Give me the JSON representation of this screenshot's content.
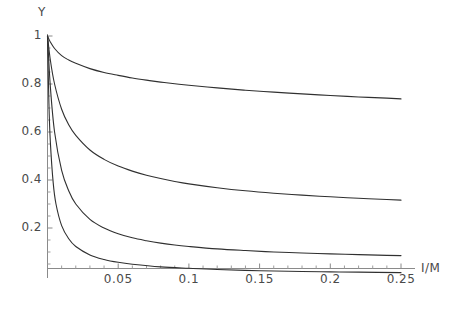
{
  "chart_data": {
    "type": "line",
    "title": "",
    "subtitle": "",
    "xlabel": "I/M",
    "ylabel": "Y",
    "xlim": [
      0,
      0.26
    ],
    "ylim": [
      0,
      1.05
    ],
    "grid": false,
    "legend": "none",
    "xticks": [
      0.05,
      0.1,
      0.15,
      0.2,
      0.25
    ],
    "xtick_labels": [
      "0.05",
      "0.1",
      "0.15",
      "0.2",
      "0.25"
    ],
    "yticks": [
      0.2,
      0.4,
      0.6,
      0.8,
      1
    ],
    "ytick_labels": [
      "0.2",
      "0.4",
      "0.6",
      "0.8",
      "1"
    ],
    "line_color": "#303030",
    "axis_color": "#808080",
    "series": [
      {
        "name": "curve-1",
        "asymptote": 0.72,
        "x": [
          0.0,
          0.002,
          0.005,
          0.01,
          0.015,
          0.02,
          0.03,
          0.04,
          0.05,
          0.06,
          0.07,
          0.08,
          0.09,
          0.1,
          0.12,
          0.14,
          0.16,
          0.18,
          0.2,
          0.22,
          0.24,
          0.25
        ],
        "y": [
          1.0,
          0.975,
          0.948,
          0.918,
          0.9,
          0.886,
          0.864,
          0.848,
          0.836,
          0.825,
          0.816,
          0.808,
          0.801,
          0.795,
          0.784,
          0.774,
          0.766,
          0.759,
          0.752,
          0.746,
          0.741,
          0.738
        ]
      },
      {
        "name": "curve-2",
        "asymptote": 0.29,
        "x": [
          0.0,
          0.002,
          0.005,
          0.01,
          0.015,
          0.02,
          0.03,
          0.04,
          0.05,
          0.06,
          0.07,
          0.08,
          0.09,
          0.1,
          0.12,
          0.14,
          0.16,
          0.18,
          0.2,
          0.22,
          0.24,
          0.25
        ],
        "y": [
          1.0,
          0.9,
          0.8,
          0.695,
          0.63,
          0.586,
          0.525,
          0.486,
          0.458,
          0.437,
          0.42,
          0.406,
          0.394,
          0.384,
          0.368,
          0.355,
          0.345,
          0.337,
          0.33,
          0.324,
          0.319,
          0.316
        ]
      },
      {
        "name": "curve-3",
        "asymptote": 0.06,
        "x": [
          0.0,
          0.002,
          0.005,
          0.01,
          0.015,
          0.02,
          0.03,
          0.04,
          0.05,
          0.06,
          0.07,
          0.08,
          0.09,
          0.1,
          0.12,
          0.14,
          0.16,
          0.18,
          0.2,
          0.22,
          0.24,
          0.25
        ],
        "y": [
          1.0,
          0.79,
          0.6,
          0.44,
          0.355,
          0.3,
          0.236,
          0.2,
          0.176,
          0.159,
          0.147,
          0.137,
          0.129,
          0.123,
          0.113,
          0.106,
          0.1,
          0.096,
          0.092,
          0.089,
          0.086,
          0.085
        ]
      },
      {
        "name": "curve-4",
        "asymptote": 0.01,
        "x": [
          0.0,
          0.001,
          0.002,
          0.004,
          0.006,
          0.01,
          0.015,
          0.02,
          0.03,
          0.04,
          0.05,
          0.06,
          0.08,
          0.1,
          0.12,
          0.15,
          0.18,
          0.2,
          0.22,
          0.25
        ],
        "y": [
          1.0,
          0.72,
          0.56,
          0.39,
          0.3,
          0.21,
          0.155,
          0.123,
          0.088,
          0.069,
          0.057,
          0.049,
          0.038,
          0.032,
          0.027,
          0.022,
          0.019,
          0.017,
          0.016,
          0.014
        ]
      }
    ]
  },
  "axes": {
    "y_axis_title": "Y",
    "x_axis_title": "I/M"
  }
}
